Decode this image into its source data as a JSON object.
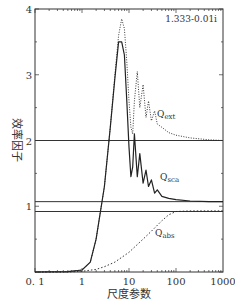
{
  "chart_data": {
    "type": "line",
    "title": "",
    "annotation": "1.333-0.01i",
    "xlabel": "尺度参数",
    "ylabel": "效率因子",
    "xscale": "log",
    "xlim": [
      0.1,
      1000
    ],
    "ylim": [
      0,
      4
    ],
    "x_ticks": [
      "0.1",
      "1",
      "10",
      "100",
      "1000"
    ],
    "y_ticks": [
      "1",
      "2",
      "3",
      "4"
    ],
    "grid": false,
    "reference_lines_y": [
      2.0,
      1.07,
      0.92
    ],
    "series": [
      {
        "name": "Q_ext",
        "label_main": "Q",
        "label_sub": "ext",
        "style": "dotted",
        "x": [
          0.1,
          0.5,
          1,
          1.5,
          2,
          3,
          4,
          5,
          6,
          7,
          8,
          9,
          10,
          11,
          12,
          13,
          15,
          17,
          20,
          23,
          26,
          30,
          35,
          40,
          50,
          70,
          100,
          200,
          500,
          1000
        ],
        "y": [
          0,
          0.005,
          0.03,
          0.15,
          0.5,
          1.3,
          2.2,
          3.0,
          3.6,
          3.85,
          3.7,
          3.2,
          2.6,
          2.2,
          2.1,
          2.6,
          3.05,
          2.5,
          2.85,
          2.35,
          2.6,
          2.3,
          2.45,
          2.25,
          2.2,
          2.12,
          2.08,
          2.04,
          2.01,
          2.0
        ]
      },
      {
        "name": "Q_sca",
        "label_main": "Q",
        "label_sub": "sca",
        "style": "solid",
        "x": [
          0.1,
          0.5,
          1,
          1.5,
          2,
          3,
          4,
          5,
          6,
          7,
          8,
          9,
          10,
          11,
          12,
          13,
          15,
          17,
          20,
          23,
          26,
          30,
          35,
          40,
          50,
          70,
          100,
          200,
          500,
          1000
        ],
        "y": [
          0,
          0.005,
          0.03,
          0.15,
          0.5,
          1.3,
          2.2,
          2.95,
          3.5,
          3.5,
          3.3,
          2.6,
          1.9,
          1.45,
          1.6,
          2.1,
          1.45,
          1.8,
          1.35,
          1.55,
          1.3,
          1.4,
          1.2,
          1.25,
          1.15,
          1.12,
          1.1,
          1.08,
          1.07,
          1.07
        ]
      },
      {
        "name": "Q_abs",
        "label_main": "Q",
        "label_sub": "abs",
        "style": "dashed",
        "x": [
          0.1,
          0.5,
          1,
          2,
          3,
          5,
          10,
          20,
          30,
          50,
          70,
          100,
          200,
          500,
          1000
        ],
        "y": [
          0,
          0.0,
          0.01,
          0.04,
          0.08,
          0.15,
          0.3,
          0.5,
          0.62,
          0.78,
          0.87,
          0.92,
          0.93,
          0.93,
          0.93
        ]
      }
    ]
  }
}
